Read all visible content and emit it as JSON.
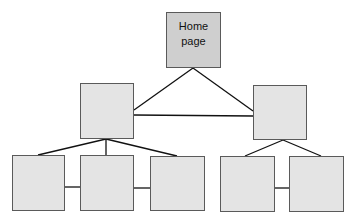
{
  "diagram": {
    "type": "site-map-hierarchy",
    "colors": {
      "home_fill": "#cfcfcf",
      "node_fill": "#e4e4e4",
      "border": "#5a5a5a",
      "line": "#111111"
    },
    "nodes": [
      {
        "id": "home",
        "label_line1": "Home",
        "label_line2": "page",
        "x": 166,
        "y": 12,
        "w": 55,
        "h": 56
      },
      {
        "id": "mid-left",
        "label_line1": "",
        "label_line2": "",
        "x": 80,
        "y": 83,
        "w": 54,
        "h": 56
      },
      {
        "id": "mid-right",
        "label_line1": "",
        "label_line2": "",
        "x": 253,
        "y": 85,
        "w": 54,
        "h": 55
      },
      {
        "id": "bottom-1",
        "label_line1": "",
        "label_line2": "",
        "x": 12,
        "y": 155,
        "w": 53,
        "h": 56
      },
      {
        "id": "bottom-2",
        "label_line1": "",
        "label_line2": "",
        "x": 80,
        "y": 155,
        "w": 54,
        "h": 56
      },
      {
        "id": "bottom-3",
        "label_line1": "",
        "label_line2": "",
        "x": 150,
        "y": 156,
        "w": 55,
        "h": 55
      },
      {
        "id": "bottom-4",
        "label_line1": "",
        "label_line2": "",
        "x": 220,
        "y": 156,
        "w": 55,
        "h": 56
      },
      {
        "id": "bottom-5",
        "label_line1": "",
        "label_line2": "",
        "x": 289,
        "y": 156,
        "w": 55,
        "h": 56
      }
    ],
    "edges": [
      [
        "home",
        "mid-left"
      ],
      [
        "home",
        "mid-right"
      ],
      [
        "mid-left",
        "mid-right"
      ],
      [
        "mid-left",
        "bottom-1"
      ],
      [
        "mid-left",
        "bottom-2"
      ],
      [
        "mid-left",
        "bottom-3"
      ],
      [
        "bottom-1",
        "bottom-2"
      ],
      [
        "bottom-2",
        "bottom-3"
      ],
      [
        "mid-right",
        "bottom-4"
      ],
      [
        "mid-right",
        "bottom-5"
      ],
      [
        "bottom-4",
        "bottom-5"
      ]
    ]
  }
}
